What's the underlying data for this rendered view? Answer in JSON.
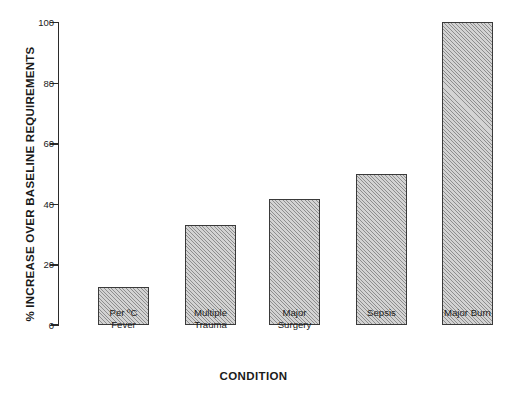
{
  "chart_data": {
    "type": "bar",
    "title": "",
    "xlabel": "CONDITION",
    "ylabel": "% INCREASE OVER BASELINE REQUIREMENTS",
    "categories": [
      "Per ºC\nFever",
      "Multiple\nTrauma",
      "Major\nSurgery",
      "Sepsis",
      "Major Burn"
    ],
    "values": [
      12.5,
      33,
      41.5,
      50,
      100
    ],
    "ylim": [
      0,
      100
    ],
    "yticks": [
      0,
      20,
      40,
      60,
      80,
      100
    ],
    "ytick_labels": [
      "0",
      "20",
      "40",
      "60",
      "80",
      "100"
    ],
    "grid": false,
    "legend": null,
    "bar_fill": "#d3d3d3",
    "bar_hatch": "diagonal-45",
    "bar_edge_color": "#3a3a3a",
    "axis_color": "#2b2b2b"
  }
}
